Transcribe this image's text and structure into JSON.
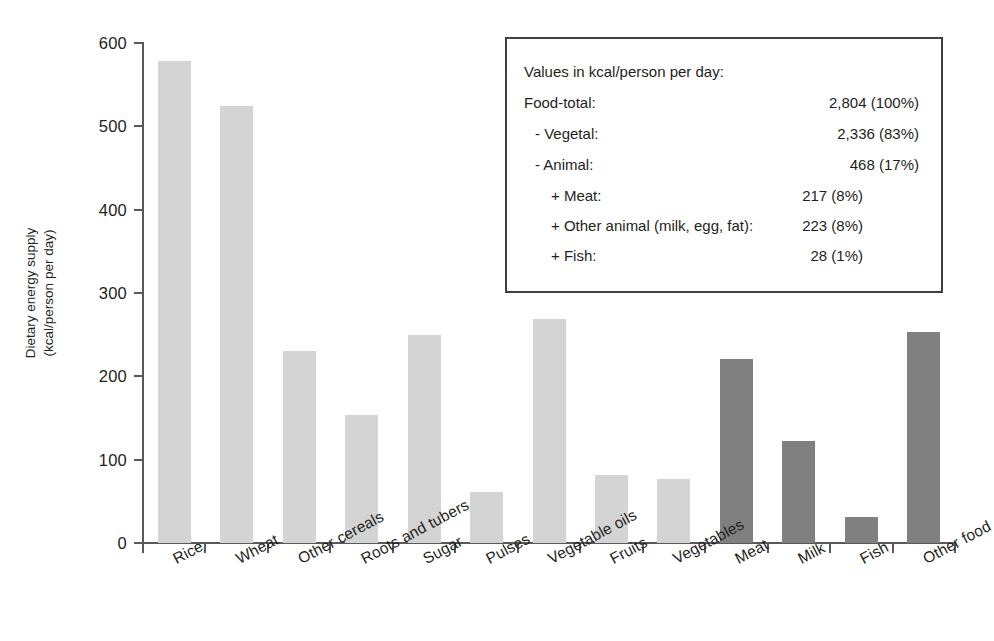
{
  "chart_data": {
    "type": "bar",
    "title": "",
    "xlabel": "",
    "ylabel": "Dietary energy supply (kcal/person per day)",
    "ylabel_line1": "Dietary energy supply",
    "ylabel_line2": "(kcal/person per day)",
    "ylim": [
      0,
      600
    ],
    "yticks": [
      0,
      100,
      200,
      300,
      400,
      500,
      600
    ],
    "ytick_labels": [
      "0",
      "100",
      "200",
      "300",
      "400",
      "500",
      "600"
    ],
    "grid": false,
    "legend_position": "top-right-inset-box",
    "categories": [
      "Rice",
      "Wheat",
      "Other cereals",
      "Roots and tubers",
      "Sugar",
      "Pulses",
      "Vegetable oils",
      "Fruits",
      "Vegetables",
      "Meat",
      "Milk",
      "Fish",
      "Other food"
    ],
    "values": [
      578,
      525,
      230,
      154,
      250,
      61,
      269,
      82,
      77,
      221,
      122,
      31,
      253
    ],
    "bar_colors": [
      "#d4d4d4",
      "#d4d4d4",
      "#d4d4d4",
      "#d4d4d4",
      "#d4d4d4",
      "#d4d4d4",
      "#d4d4d4",
      "#d4d4d4",
      "#d4d4d4",
      "#808080",
      "#808080",
      "#808080",
      "#808080"
    ],
    "color_groups": {
      "vegetal": "#d4d4d4",
      "animal": "#808080"
    }
  },
  "legend": {
    "title": "Values in kcal/person per day:",
    "rows": [
      {
        "label": "Food-total:",
        "value": "2,804 (100%)",
        "indent": 0
      },
      {
        "label": "- Vegetal:",
        "value": "2,336  (83%)",
        "indent": 1
      },
      {
        "label": "- Animal:",
        "value": "468  (17%)",
        "indent": 1
      },
      {
        "label": "+ Meat:",
        "value": "217 (8%)",
        "indent": 2
      },
      {
        "label": "+ Other animal (milk, egg, fat):",
        "value": "223 (8%)",
        "indent": 2
      },
      {
        "label": "+ Fish:",
        "value": "28 (1%)",
        "indent": 2
      }
    ]
  }
}
